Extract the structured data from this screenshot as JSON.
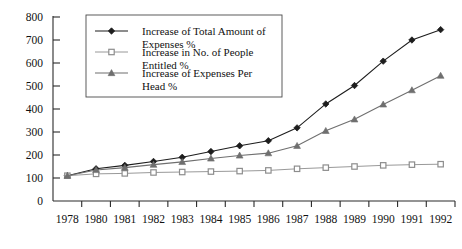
{
  "chart_data": {
    "type": "line",
    "title": "",
    "subtitle": "",
    "xlabel": "",
    "ylabel": "",
    "ylim": [
      0,
      800
    ],
    "yticks": [
      0,
      100,
      200,
      300,
      400,
      500,
      600,
      700,
      800
    ],
    "grid": false,
    "legend_position": "top-left-inside",
    "categories": [
      "1978",
      "1980",
      "1981",
      "1982",
      "1983",
      "1984",
      "1985",
      "1986",
      "1987",
      "1988",
      "1989",
      "1990",
      "1991",
      "1992"
    ],
    "series": [
      {
        "name": "Increase of Total Amount of Expenses %",
        "marker": "diamond",
        "color": "#1d1d1d",
        "values": [
          110,
          140,
          155,
          172,
          190,
          215,
          240,
          262,
          318,
          422,
          502,
          608,
          700,
          745
        ]
      },
      {
        "name": "Increase in No. of People Entitled %",
        "marker": "square",
        "color": "#8d8d8d",
        "values": [
          110,
          118,
          120,
          124,
          126,
          128,
          130,
          133,
          140,
          145,
          150,
          155,
          158,
          160
        ]
      },
      {
        "name": "Increase of Expenses Per Head %",
        "marker": "triangle",
        "color": "#6f6f6f",
        "values": [
          110,
          135,
          145,
          158,
          170,
          185,
          198,
          208,
          240,
          305,
          355,
          420,
          482,
          545
        ]
      }
    ]
  },
  "legend": {
    "entries": [
      {
        "label_line1": "Increase of Total Amount of",
        "label_line2": "Expenses %",
        "marker": "diamond-marker"
      },
      {
        "label_line1": "Increase in No. of People",
        "label_line2": "Entitled %",
        "marker": "square-marker"
      },
      {
        "label_line1": "Increase of Expenses Per",
        "label_line2": "Head %",
        "marker": "triangle-marker"
      }
    ]
  },
  "axes": {
    "y_labels": [
      "800",
      "700",
      "600",
      "500",
      "400",
      "300",
      "200",
      "100",
      "0"
    ],
    "x_labels": [
      "1978",
      "1980",
      "1981",
      "1982",
      "1983",
      "1984",
      "1985",
      "1986",
      "1987",
      "1988",
      "1989",
      "1990",
      "1991",
      "1992"
    ]
  }
}
